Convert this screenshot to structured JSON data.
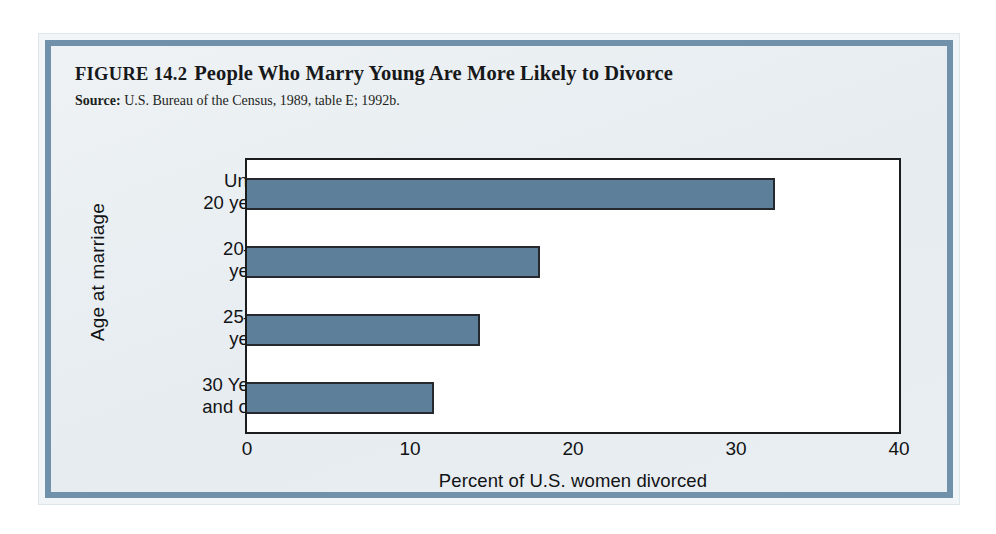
{
  "figure": {
    "number": "FIGURE 14.2",
    "title": "People Who Marry Young Are More Likely to Divorce",
    "source_label": "Source:",
    "source_text": " U.S. Bureau of the Census, 1989, table E; 1992b."
  },
  "colors": {
    "bar": "#5d7f99",
    "bar_outline": "#25282c",
    "frame_band": "#7191ab",
    "card_background": "#e8edf1",
    "plot_background": "#ffffff"
  },
  "chart_data": {
    "type": "bar",
    "orientation": "horizontal",
    "title": "People Who Marry Young Are More Likely to Divorce",
    "subtitle": "Source: U.S. Bureau of the Census, 1989, table E; 1992b.",
    "categories": [
      "Under 20 years",
      "20–24 years",
      "25–29 years",
      "30 Years and over"
    ],
    "category_lines": [
      [
        "Under",
        "20 years"
      ],
      [
        "20–24",
        "years"
      ],
      [
        "25–29",
        "years"
      ],
      [
        "30 Years",
        "and over"
      ]
    ],
    "values": [
      32.4,
      18.0,
      14.3,
      11.5
    ],
    "xlabel": "Percent of U.S. women divorced",
    "ylabel": "Age at marriage",
    "xlim": [
      0,
      40
    ],
    "xticks": [
      0,
      10,
      20,
      30,
      40
    ],
    "xtick_labels": [
      "0",
      "10",
      "20",
      "30",
      "40"
    ],
    "grid": false,
    "legend": false
  }
}
